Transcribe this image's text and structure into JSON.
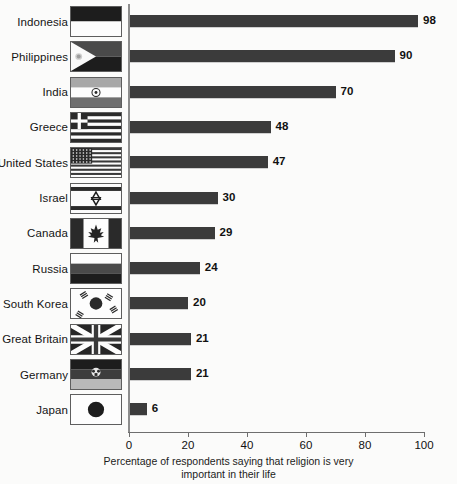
{
  "chart_data": {
    "type": "bar",
    "orientation": "horizontal",
    "title": "",
    "xlabel": "Percentage of respondents saying that religion is very important in their life",
    "ylabel": "",
    "xlim": [
      0,
      100
    ],
    "xticks": [
      0,
      20,
      40,
      60,
      80,
      100
    ],
    "grid": false,
    "legend": null,
    "categories": [
      "Indonesia",
      "Philippines",
      "India",
      "Greece",
      "United States",
      "Israel",
      "Canada",
      "Russia",
      "South Korea",
      "Great Britain",
      "Germany",
      "Japan"
    ],
    "values": [
      98,
      90,
      70,
      48,
      47,
      30,
      29,
      24,
      20,
      21,
      21,
      6
    ],
    "bar_color": "#3b3b3b",
    "axis_color": "#8d8d8d",
    "background": "#fbfbfa"
  },
  "axis": {
    "caption_line1": "Percentage of respondents saying that religion is very",
    "caption_line2": "important in their life",
    "ticks": [
      {
        "label": "0",
        "value": 0
      },
      {
        "label": "20",
        "value": 20
      },
      {
        "label": "40",
        "value": 40
      },
      {
        "label": "60",
        "value": 60
      },
      {
        "label": "80",
        "value": 80
      },
      {
        "label": "100",
        "value": 100
      }
    ]
  },
  "rows": [
    {
      "country": "Indonesia",
      "value": 98,
      "value_label": "98",
      "flag": "flag-indonesia"
    },
    {
      "country": "Philippines",
      "value": 90,
      "value_label": "90",
      "flag": "flag-philippines"
    },
    {
      "country": "India",
      "value": 70,
      "value_label": "70",
      "flag": "flag-india"
    },
    {
      "country": "Greece",
      "value": 48,
      "value_label": "48",
      "flag": "flag-greece"
    },
    {
      "country": "United States",
      "value": 47,
      "value_label": "47",
      "flag": "flag-united-states"
    },
    {
      "country": "Israel",
      "value": 30,
      "value_label": "30",
      "flag": "flag-israel"
    },
    {
      "country": "Canada",
      "value": 29,
      "value_label": "29",
      "flag": "flag-canada"
    },
    {
      "country": "Russia",
      "value": 24,
      "value_label": "24",
      "flag": "flag-russia"
    },
    {
      "country": "South Korea",
      "value": 20,
      "value_label": "20",
      "flag": "flag-south-korea"
    },
    {
      "country": "Great Britain",
      "value": 21,
      "value_label": "21",
      "flag": "flag-great-britain"
    },
    {
      "country": "Germany",
      "value": 21,
      "value_label": "21",
      "flag": "flag-germany"
    },
    {
      "country": "Japan",
      "value": 6,
      "value_label": "6",
      "flag": "flag-japan"
    }
  ]
}
